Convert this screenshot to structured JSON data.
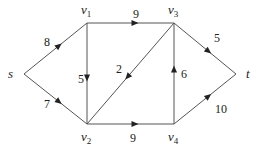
{
  "diagram": {
    "type": "directed-flow-network",
    "nodes": [
      {
        "id": "s",
        "label": "s",
        "sub": "",
        "x": 24,
        "y": 74,
        "lx": 8,
        "ly": 78
      },
      {
        "id": "v1",
        "label": "v",
        "sub": "1",
        "x": 87,
        "y": 23,
        "lx": 81,
        "ly": 14
      },
      {
        "id": "v3",
        "label": "v",
        "sub": "3",
        "x": 174,
        "y": 23,
        "lx": 168,
        "ly": 14
      },
      {
        "id": "v2",
        "label": "v",
        "sub": "2",
        "x": 87,
        "y": 124,
        "lx": 81,
        "ly": 141
      },
      {
        "id": "v4",
        "label": "v",
        "sub": "4",
        "x": 174,
        "y": 124,
        "lx": 168,
        "ly": 141
      },
      {
        "id": "t",
        "label": "t",
        "sub": "",
        "x": 236,
        "y": 74,
        "lx": 246,
        "ly": 78
      }
    ],
    "edges": [
      {
        "from": "s",
        "to": "v1",
        "weight": "8",
        "wx": 44,
        "wy": 46
      },
      {
        "from": "s",
        "to": "v2",
        "weight": "7",
        "wx": 44,
        "wy": 108
      },
      {
        "from": "v1",
        "to": "v3",
        "weight": "9",
        "wx": 133,
        "wy": 18
      },
      {
        "from": "v1",
        "to": "v2",
        "weight": "5",
        "wx": 78,
        "wy": 83
      },
      {
        "from": "v3",
        "to": "v2",
        "weight": "2",
        "wx": 116,
        "wy": 73
      },
      {
        "from": "v2",
        "to": "v4",
        "weight": "9",
        "wx": 130,
        "wy": 142
      },
      {
        "from": "v4",
        "to": "v3",
        "weight": "6",
        "wx": 181,
        "wy": 78
      },
      {
        "from": "v3",
        "to": "t",
        "weight": "5",
        "wx": 214,
        "wy": 42
      },
      {
        "from": "v4",
        "to": "t",
        "weight": "10",
        "wx": 215,
        "wy": 113
      }
    ]
  }
}
